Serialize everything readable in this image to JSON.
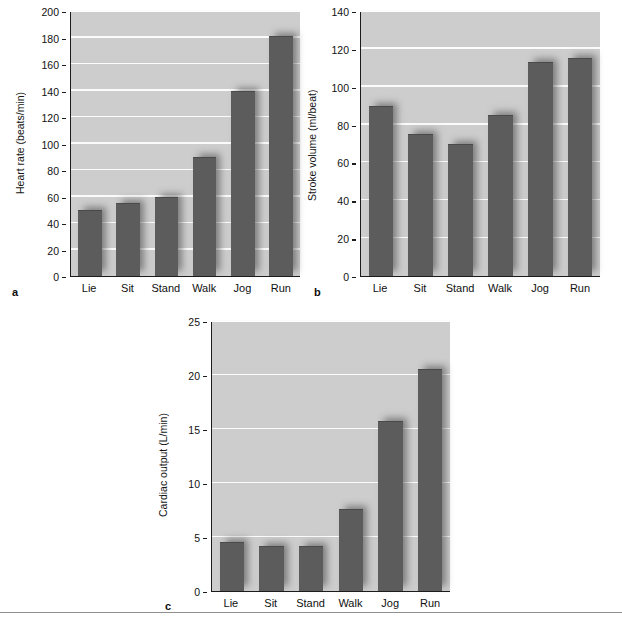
{
  "figure": {
    "panels": [
      "a",
      "b",
      "c"
    ],
    "bar_color": "#5c5c5c",
    "plot_background": "#cdcdcd",
    "gridline_color": "#fbfbfb",
    "axis_color": "#1c1c1c"
  },
  "chart_data": [
    {
      "panel_label": "a",
      "type": "bar",
      "title": "",
      "xlabel": "",
      "ylabel": "Heart rate (beats/min)",
      "categories": [
        "Lie",
        "Sit",
        "Stand",
        "Walk",
        "Jog",
        "Run"
      ],
      "values": [
        50,
        55,
        60,
        90,
        140,
        181
      ],
      "ylim": [
        0,
        200
      ],
      "yticks": [
        0,
        20,
        40,
        60,
        80,
        100,
        120,
        140,
        160,
        180,
        200
      ],
      "ytick_labels": [
        "0",
        "20",
        "40",
        "60",
        "80",
        "100",
        "120",
        "140",
        "160",
        "180",
        "200"
      ],
      "grid": true,
      "legend": null
    },
    {
      "panel_label": "b",
      "type": "bar",
      "title": "",
      "xlabel": "",
      "ylabel": "Stroke volume (ml/beat)",
      "categories": [
        "Lie",
        "Sit",
        "Stand",
        "Walk",
        "Jog",
        "Run"
      ],
      "values": [
        90,
        75,
        70,
        85,
        113,
        115
      ],
      "ylim": [
        0,
        140
      ],
      "yticks": [
        0,
        20,
        40,
        60,
        80,
        100,
        120,
        140
      ],
      "ytick_labels": [
        "0",
        "20",
        "40",
        "60",
        "80",
        "100",
        "120",
        "140"
      ],
      "grid": true,
      "legend": null
    },
    {
      "panel_label": "c",
      "type": "bar",
      "title": "",
      "xlabel": "",
      "ylabel": "Cardiac output (L/min)",
      "categories": [
        "Lie",
        "Sit",
        "Stand",
        "Walk",
        "Jog",
        "Run"
      ],
      "values": [
        4.5,
        4.2,
        4.2,
        7.6,
        15.7,
        20.6
      ],
      "ylim": [
        0,
        25
      ],
      "yticks": [
        0,
        5,
        10,
        15,
        20,
        25
      ],
      "ytick_labels": [
        "0",
        "5",
        "10",
        "15",
        "20",
        "25"
      ],
      "grid": true,
      "legend": null
    }
  ]
}
